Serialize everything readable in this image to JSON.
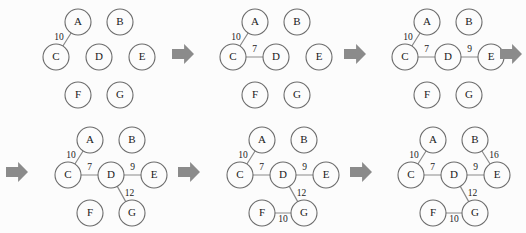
{
  "figure": {
    "background_color": "#fcfcfc",
    "node_fill": "#fcfcfc",
    "node_stroke": "#6b6b6b",
    "edge_color": "#8a8a8a",
    "arrow_color": "#8b8b8b",
    "text_color": "#1a1a1a",
    "node_radius": 13,
    "width": 526,
    "height": 233
  },
  "graph": {
    "vertices": [
      "A",
      "B",
      "C",
      "D",
      "E",
      "F",
      "G"
    ],
    "layout": [
      {
        "id": "A",
        "x": 55,
        "y": 17
      },
      {
        "id": "B",
        "x": 97,
        "y": 17
      },
      {
        "id": "C",
        "x": 33,
        "y": 52
      },
      {
        "id": "D",
        "x": 76,
        "y": 52
      },
      {
        "id": "E",
        "x": 119,
        "y": 52
      },
      {
        "id": "F",
        "x": 55,
        "y": 90
      },
      {
        "id": "G",
        "x": 97,
        "y": 90
      }
    ],
    "all_edges": [
      {
        "from": "A",
        "to": "C",
        "weight": "10"
      },
      {
        "from": "C",
        "to": "D",
        "weight": "7"
      },
      {
        "from": "D",
        "to": "E",
        "weight": "9"
      },
      {
        "from": "D",
        "to": "G",
        "weight": "12"
      },
      {
        "from": "F",
        "to": "G",
        "weight": "10"
      },
      {
        "from": "B",
        "to": "E",
        "weight": "16"
      }
    ]
  },
  "panels": [
    {
      "index": 1,
      "name": "step-1",
      "origin": {
        "x": 23,
        "y": 5
      },
      "edges": [
        {
          "from": "A",
          "to": "C",
          "weight": "10",
          "label_dx": -8,
          "label_dy": -2
        }
      ]
    },
    {
      "index": 2,
      "name": "step-2",
      "origin": {
        "x": 200,
        "y": 5
      },
      "edges": [
        {
          "from": "A",
          "to": "C",
          "weight": "10",
          "label_dx": -8,
          "label_dy": -2
        },
        {
          "from": "C",
          "to": "D",
          "weight": "7",
          "label_dx": 0,
          "label_dy": -7
        }
      ]
    },
    {
      "index": 3,
      "name": "step-3",
      "origin": {
        "x": 372,
        "y": 5
      },
      "edges": [
        {
          "from": "A",
          "to": "C",
          "weight": "10",
          "label_dx": -8,
          "label_dy": -2
        },
        {
          "from": "C",
          "to": "D",
          "weight": "7",
          "label_dx": 0,
          "label_dy": -7
        },
        {
          "from": "D",
          "to": "E",
          "weight": "9",
          "label_dx": 0,
          "label_dy": -7
        }
      ]
    },
    {
      "index": 4,
      "name": "step-4",
      "origin": {
        "x": 35,
        "y": 123
      },
      "edges": [
        {
          "from": "A",
          "to": "C",
          "weight": "10",
          "label_dx": -8,
          "label_dy": -2
        },
        {
          "from": "C",
          "to": "D",
          "weight": "7",
          "label_dx": 0,
          "label_dy": -7
        },
        {
          "from": "D",
          "to": "E",
          "weight": "9",
          "label_dx": 0,
          "label_dy": -7
        },
        {
          "from": "D",
          "to": "G",
          "weight": "12",
          "label_dx": 8,
          "label_dy": 0
        }
      ]
    },
    {
      "index": 5,
      "name": "step-5",
      "origin": {
        "x": 207,
        "y": 123
      },
      "edges": [
        {
          "from": "A",
          "to": "C",
          "weight": "10",
          "label_dx": -8,
          "label_dy": -2
        },
        {
          "from": "C",
          "to": "D",
          "weight": "7",
          "label_dx": 0,
          "label_dy": -7
        },
        {
          "from": "D",
          "to": "E",
          "weight": "9",
          "label_dx": 0,
          "label_dy": -7
        },
        {
          "from": "D",
          "to": "G",
          "weight": "12",
          "label_dx": 8,
          "label_dy": 0
        },
        {
          "from": "F",
          "to": "G",
          "weight": "10",
          "label_dx": 0,
          "label_dy": 7
        }
      ]
    },
    {
      "index": 6,
      "name": "step-6",
      "origin": {
        "x": 378,
        "y": 123
      },
      "edges": [
        {
          "from": "A",
          "to": "C",
          "weight": "10",
          "label_dx": -8,
          "label_dy": -2
        },
        {
          "from": "C",
          "to": "D",
          "weight": "7",
          "label_dx": 0,
          "label_dy": -7
        },
        {
          "from": "D",
          "to": "E",
          "weight": "9",
          "label_dx": 0,
          "label_dy": -7
        },
        {
          "from": "D",
          "to": "G",
          "weight": "12",
          "label_dx": 8,
          "label_dy": 0
        },
        {
          "from": "F",
          "to": "G",
          "weight": "10",
          "label_dx": 0,
          "label_dy": 7
        },
        {
          "from": "B",
          "to": "E",
          "weight": "16",
          "label_dx": 8,
          "label_dy": -2
        }
      ]
    }
  ],
  "arrows": [
    {
      "name": "arrow-step1-to-step2",
      "x": 172,
      "y": 44,
      "w": 22,
      "h": 20
    },
    {
      "name": "arrow-step2-to-step3",
      "x": 344,
      "y": 44,
      "w": 22,
      "h": 20
    },
    {
      "name": "arrow-step3-to-step4",
      "x": 500,
      "y": 44,
      "w": 22,
      "h": 20
    },
    {
      "name": "arrow-step3-to-step4-continue",
      "x": 6,
      "y": 162,
      "w": 22,
      "h": 20
    },
    {
      "name": "arrow-step4-to-step5",
      "x": 178,
      "y": 162,
      "w": 22,
      "h": 20
    },
    {
      "name": "arrow-step5-to-step6",
      "x": 350,
      "y": 162,
      "w": 22,
      "h": 20
    }
  ]
}
